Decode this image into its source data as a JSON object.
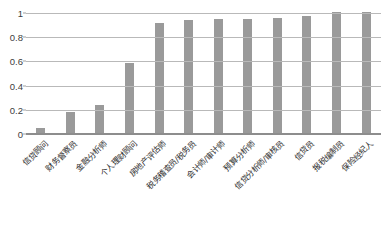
{
  "chart_data": {
    "type": "bar",
    "title": "",
    "xlabel": "",
    "ylabel": "",
    "ylim": [
      0,
      1
    ],
    "grid": true,
    "legend": "none",
    "orientation": "vertical",
    "bar_color": "#9a9a9a",
    "categories": [
      "信贷顾问",
      "财务督察员",
      "金融分析师",
      "个人理财顾问",
      "房地产评估师",
      "税务稽查员/税务员",
      "会计师/审计师",
      "预算分析师",
      "信贷分析师/审核员",
      "信贷员",
      "报税编制员",
      "保险经纪人"
    ],
    "values": [
      0.04,
      0.17,
      0.23,
      0.58,
      0.91,
      0.93,
      0.94,
      0.94,
      0.95,
      0.97,
      1.0,
      1.0
    ],
    "y_ticks": [
      {
        "value": 1,
        "label": "1"
      },
      {
        "value": 0.8,
        "label": "0.8"
      },
      {
        "value": 0.6,
        "label": "0.6"
      },
      {
        "value": 0.4,
        "label": "0.4"
      },
      {
        "value": 0.2,
        "label": "0.2"
      },
      {
        "value": 0,
        "label": "0"
      }
    ]
  }
}
